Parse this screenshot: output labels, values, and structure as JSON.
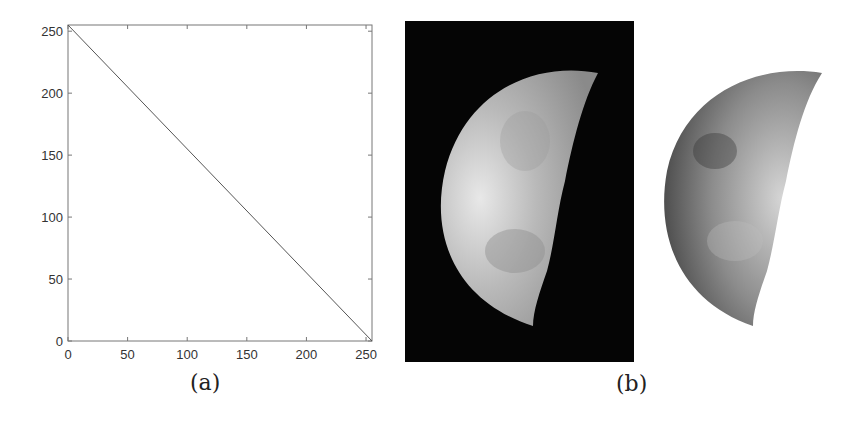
{
  "figure": {
    "panel_a": {
      "caption": "(a)"
    },
    "panel_b": {
      "caption": "(b)",
      "left_image": "original-moon-photo",
      "right_image": "negative-moon-photo"
    }
  },
  "chart_data": {
    "type": "line",
    "title": "",
    "xlabel": "",
    "ylabel": "",
    "xlim": [
      0,
      255
    ],
    "ylim": [
      0,
      255
    ],
    "xticks": [
      0,
      50,
      100,
      150,
      200,
      250
    ],
    "yticks": [
      0,
      50,
      100,
      150,
      200,
      250
    ],
    "xtick_labels": [
      "0",
      "50",
      "100",
      "150",
      "200",
      "250"
    ],
    "ytick_labels": [
      "0",
      "50",
      "100",
      "150",
      "200",
      "250"
    ],
    "grid": false,
    "legend": null,
    "series": [
      {
        "name": "s = 255 - r",
        "x": [
          0,
          255
        ],
        "y": [
          255,
          0
        ]
      }
    ]
  }
}
